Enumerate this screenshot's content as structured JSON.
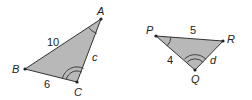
{
  "diagram": {
    "fill_color": "#b8b8b8",
    "stroke_color": "#333333",
    "triangles": [
      {
        "name": "ABC",
        "vertices": {
          "A": "A",
          "B": "B",
          "C": "C"
        },
        "sides": {
          "AB": "10",
          "BC": "6",
          "AC": "c"
        },
        "angle_marks": {
          "A": "single arc",
          "C": "double arc"
        }
      },
      {
        "name": "PQR",
        "vertices": {
          "P": "P",
          "Q": "Q",
          "R": "R"
        },
        "sides": {
          "PR": "5",
          "PQ": "4",
          "QR": "d"
        },
        "angle_marks": {
          "P": "single arc",
          "Q": "double arc"
        }
      }
    ]
  }
}
